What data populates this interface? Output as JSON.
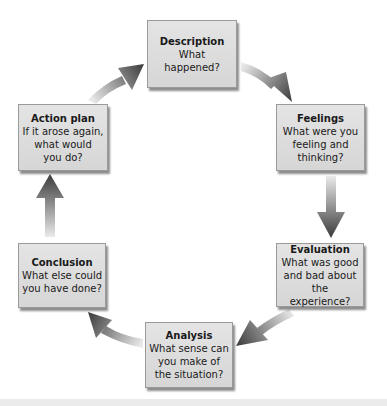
{
  "diagram": {
    "type": "cycle",
    "colors": {
      "box_fill": "#dcdcdc",
      "box_border": "#9a9a9a",
      "arrow_head": "#3c3c3c",
      "arrow_tail": "#e0e0e0",
      "text": "#1a1a1a",
      "background": "#ffffff"
    },
    "stages": [
      {
        "id": "description",
        "title": "Description",
        "body": "What happened?"
      },
      {
        "id": "feelings",
        "title": "Feelings",
        "body": "What were you\nfeeling and\nthinking?"
      },
      {
        "id": "evaluation",
        "title": "Evaluation",
        "body": "What was good\nand bad about\nthe experience?"
      },
      {
        "id": "analysis",
        "title": "Analysis",
        "body": "What sense can\nyou make of\nthe situation?"
      },
      {
        "id": "conclusion",
        "title": "Conclusion",
        "body": "What else could\nyou have done?"
      },
      {
        "id": "action_plan",
        "title": "Action plan",
        "body": "If it arose again,\nwhat would\nyou do?"
      }
    ],
    "arrows": [
      {
        "from": "description",
        "to": "feelings",
        "icon": "curved-arrow-icon"
      },
      {
        "from": "feelings",
        "to": "evaluation",
        "icon": "down-arrow-icon"
      },
      {
        "from": "evaluation",
        "to": "analysis",
        "icon": "curved-arrow-icon"
      },
      {
        "from": "analysis",
        "to": "conclusion",
        "icon": "curved-arrow-icon"
      },
      {
        "from": "conclusion",
        "to": "action_plan",
        "icon": "up-arrow-icon"
      },
      {
        "from": "action_plan",
        "to": "description",
        "icon": "curved-arrow-icon"
      }
    ]
  }
}
